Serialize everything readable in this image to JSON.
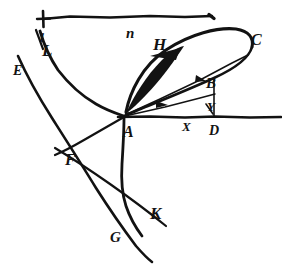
{
  "figure": {
    "background_color": "#ffffff",
    "ink_color": "#121212",
    "width": 282,
    "height": 269
  },
  "labels": [
    {
      "key": "n",
      "text": "n",
      "x": 126,
      "y": 26,
      "size": 15,
      "rotate": 0
    },
    {
      "key": "l",
      "text": "l",
      "x": 40,
      "y": 31,
      "size": 13,
      "rotate": 6
    },
    {
      "key": "L",
      "text": "L",
      "x": 42,
      "y": 42,
      "size": 17,
      "rotate": 0
    },
    {
      "key": "E",
      "text": "E",
      "x": 13,
      "y": 64,
      "size": 14,
      "rotate": 0
    },
    {
      "key": "H",
      "text": "H",
      "x": 153,
      "y": 36,
      "size": 17,
      "rotate": 0
    },
    {
      "key": "C",
      "text": "C",
      "x": 251,
      "y": 32,
      "size": 16,
      "rotate": 0
    },
    {
      "key": "B",
      "text": "B",
      "x": 206,
      "y": 76,
      "size": 15,
      "rotate": 0
    },
    {
      "key": "Y",
      "text": "Y",
      "x": 207,
      "y": 100,
      "size": 13,
      "rotate": 0
    },
    {
      "key": "D",
      "text": "D",
      "x": 209,
      "y": 124,
      "size": 14,
      "rotate": 0
    },
    {
      "key": "X",
      "text": "X",
      "x": 182,
      "y": 120,
      "size": 13,
      "rotate": 0
    },
    {
      "key": "A",
      "text": "A",
      "x": 123,
      "y": 124,
      "size": 16,
      "rotate": 0
    },
    {
      "key": "F",
      "text": "F",
      "x": 65,
      "y": 152,
      "size": 16,
      "rotate": 0
    },
    {
      "key": "K",
      "text": "K",
      "x": 150,
      "y": 205,
      "size": 17,
      "rotate": 0
    },
    {
      "key": "G",
      "text": "G",
      "x": 110,
      "y": 230,
      "size": 15,
      "rotate": 0
    }
  ],
  "strokes": {
    "top_measure_line": "M 43 19 L 70 16.5 L 110 17.5 L 150 16 L 185 17 L 212 16",
    "top_tick_left_v": "M 43 11 L 43.5 27",
    "top_tick_left_h": "M 37 19 L 50 18.5",
    "top_tick_right": "M 209 14.5 L 214 18.5",
    "baseline": "M 118 117 L 150 116.5 L 185 117.5 L 215 116.5 L 250 117.5 L 281 117",
    "loop_upper": "M 126 112 C 130 92, 142 66, 166 50 C 190 34, 218 27, 236 29 C 249 31, 254 38, 252 47",
    "loop_lower": "M 252 47 C 249 58, 236 68, 214 78 C 190 89, 160 101, 138 110 C 132 113, 128 114, 126 114",
    "chord_ac": "M 125 115 L 160 99 L 200 80 L 232 63 L 248 55",
    "chord_ab": "M 125 116 L 165 107 L 200 98 L 215 94",
    "vert_bd": "M 214 80 L 214 117",
    "seg_yd": "M 206 104 L 213 114",
    "curve_L_to_A": "M 40 31 C 44 45, 50 58, 58 70 C 68 83, 82 96, 96 104 C 108 111, 118 114, 124 116",
    "curve_l_short": "M 36 30 C 39 38, 41 44, 43 49",
    "curve_E_long": "M 18 56 C 26 74, 38 96, 52 118 C 66 140, 82 165, 96 188 C 110 210, 124 230, 136 246 C 143 254, 148 259, 152 262",
    "curve_A_to_K": "M 124 118 C 124 132, 123 148, 122 164 C 121 180, 122 194, 126 206 C 130 218, 136 228, 142 236",
    "line_F_to_K": "M 55 148 C 70 157, 90 170, 110 184 C 130 198, 150 213, 166 226",
    "line_A_to_F": "M 124 117 C 112 124, 98 132, 84 140 C 72 147, 62 152, 55 155",
    "arrowhead_H": "M 150 56 L 180 48 L 176 60 Z",
    "arrow_ac_mark": "M 196 75 L 206 81 L 195 82 Z",
    "arrow_ab_mark": "M 156 101 L 168 105 L 156 108 Z",
    "wedge_shade": "M 127 111 C 134 96, 146 76, 162 60 C 170 52, 178 47, 184 46 C 178 55, 168 70, 156 84 C 144 98, 134 107, 127 113 Z"
  }
}
